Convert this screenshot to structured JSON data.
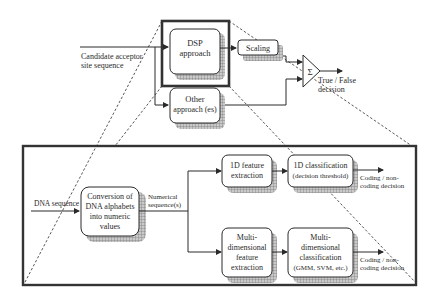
{
  "top": {
    "input_label_line1": "Candidate acceptor",
    "input_label_line2": "site sequence",
    "dsp_box": {
      "line1": "DSP",
      "line2": "approach"
    },
    "scaling_box": {
      "label": "Scaling"
    },
    "other_box": {
      "line1": "Other",
      "line2": "approach (es)"
    },
    "sum_symbol": "Σ",
    "output_label_line1": "True / False",
    "output_label_line2": "decision"
  },
  "bottom": {
    "input_label": "DNA sequence",
    "conversion_box": {
      "line1": "Conversion of",
      "line2": "DNA alphabets",
      "line3": "into numeric",
      "line4": "values"
    },
    "numeric_label_line1": "Numerical",
    "numeric_label_line2": "sequence(s)",
    "feature_1d_box": {
      "line1": "1D feature",
      "line2": "extraction"
    },
    "class_1d_box": {
      "line1": "1D classification",
      "line2": "(decision threshold)"
    },
    "output_1d_line1": "Coding / non-",
    "output_1d_line2": "coding decision",
    "feature_md_box": {
      "line1": "Multi-",
      "line2": "dimensional",
      "line3": "feature",
      "line4": "extraction"
    },
    "class_md_box": {
      "line1": "Multi-",
      "line2": "dimensional",
      "line3": "classification",
      "line4": "(GMM, SVM, etc.)"
    },
    "output_md_line1": "Coding / non-",
    "output_md_line2": "coding decision"
  },
  "colors": {
    "line": "#2a2a2a",
    "shadow": "#9a9a9a",
    "frame": "#333333"
  }
}
